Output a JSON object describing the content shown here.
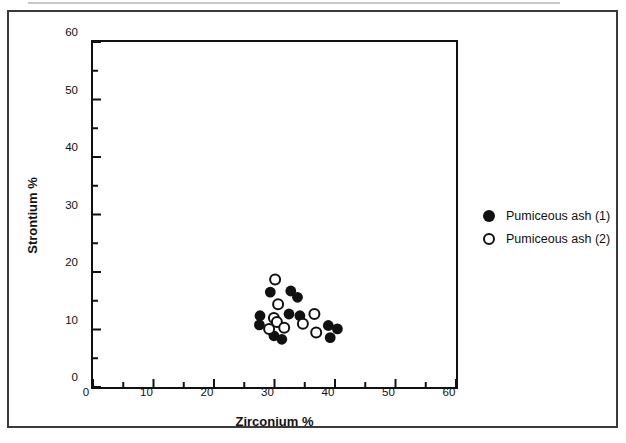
{
  "figure": {
    "background": "#ffffff",
    "frame_color": "#3a3a3a",
    "ink_color": "#111111"
  },
  "legend": {
    "items": [
      {
        "label": "Pumiceous ash (1)",
        "marker": "filled-circle"
      },
      {
        "label": "Pumiceous ash (2)",
        "marker": "open-circle"
      }
    ]
  },
  "chart_data": {
    "type": "scatter",
    "title": "",
    "xlabel": "Zirconium %",
    "ylabel": "Strontium %",
    "xlim": [
      0,
      60
    ],
    "ylim": [
      0,
      60
    ],
    "x_major_ticks": [
      0,
      10,
      20,
      30,
      40,
      50,
      60
    ],
    "x_minor_ticks": [
      5,
      15,
      25,
      35,
      45,
      55
    ],
    "y_major_ticks": [
      0,
      10,
      20,
      30,
      40,
      50,
      60
    ],
    "y_minor_ticks": [
      5,
      15,
      25,
      35,
      45,
      55
    ],
    "grid": false,
    "legend_position": "right-outside",
    "marker_radius_px": 5.4,
    "series": [
      {
        "name": "Pumiceous ash (1)",
        "marker": "filled-circle",
        "color": "#111111",
        "points": [
          [
            29.3,
            16.5
          ],
          [
            32.7,
            16.7
          ],
          [
            33.8,
            15.6
          ],
          [
            27.6,
            12.4
          ],
          [
            32.4,
            12.7
          ],
          [
            34.2,
            12.4
          ],
          [
            27.5,
            10.8
          ],
          [
            29.9,
            8.9
          ],
          [
            31.2,
            8.3
          ],
          [
            38.9,
            10.7
          ],
          [
            40.4,
            10.1
          ],
          [
            39.2,
            8.6
          ]
        ]
      },
      {
        "name": "Pumiceous ash (2)",
        "marker": "open-circle",
        "color": "#111111",
        "points": [
          [
            30.1,
            18.7
          ],
          [
            30.6,
            14.4
          ],
          [
            29.9,
            12.0
          ],
          [
            30.4,
            11.3
          ],
          [
            29.1,
            10.1
          ],
          [
            31.6,
            10.3
          ],
          [
            36.6,
            12.7
          ],
          [
            34.7,
            11.0
          ],
          [
            36.9,
            9.5
          ]
        ]
      }
    ]
  }
}
